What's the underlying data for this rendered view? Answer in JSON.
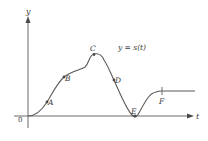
{
  "figure": {
    "y_axis_label": "y",
    "t_axis_label": "t",
    "origin_label": "0",
    "function_label": "y = s(t)",
    "colors": {
      "axis": "#6a6a6a",
      "curve": "#5a5a5a",
      "text": "#3a3a3a",
      "background": "#ffffff"
    },
    "points": [
      {
        "label": "A",
        "x": 47,
        "y": 102
      },
      {
        "label": "B",
        "x": 64,
        "y": 77
      },
      {
        "label": "C",
        "x": 94,
        "y": 55
      },
      {
        "label": "D",
        "x": 114,
        "y": 80
      },
      {
        "label": "E",
        "x": 135,
        "y": 116
      },
      {
        "label": "F",
        "x": 162,
        "y": 91
      }
    ]
  }
}
